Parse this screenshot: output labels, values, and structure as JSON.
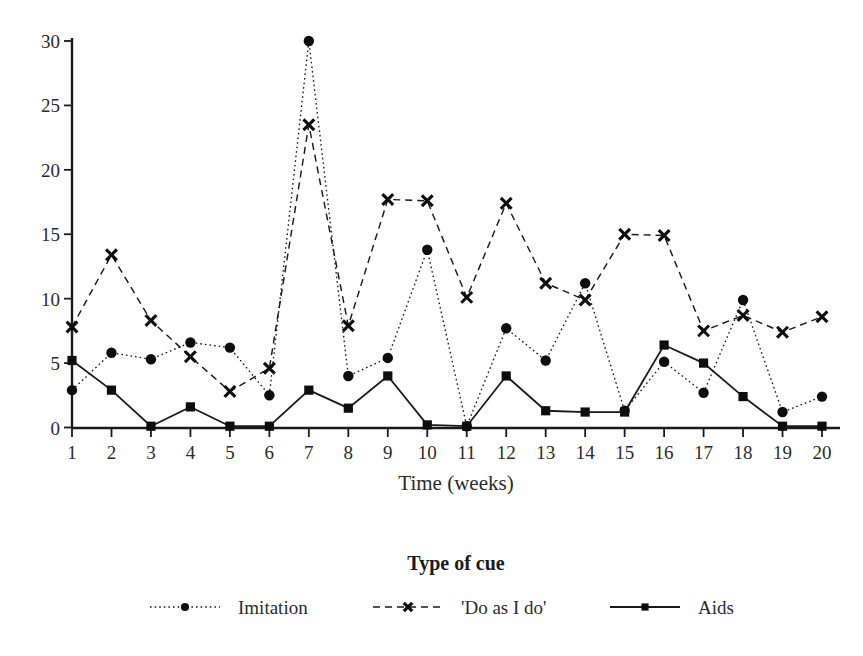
{
  "chart_data": {
    "type": "line",
    "title": "",
    "xlabel": "Time (weeks)",
    "ylabel": "",
    "legend_title": "Type of cue",
    "legend_position": "bottom",
    "grid": false,
    "xlim": [
      1,
      20
    ],
    "ylim": [
      0,
      30
    ],
    "yticks": [
      0,
      5,
      10,
      15,
      20,
      25,
      30
    ],
    "ytick_labels": [
      "0",
      "5",
      "10",
      "15",
      "20",
      "25",
      "30"
    ],
    "x": [
      1,
      2,
      3,
      4,
      5,
      6,
      7,
      8,
      9,
      10,
      11,
      12,
      13,
      14,
      15,
      16,
      17,
      18,
      19,
      20
    ],
    "xtick_labels": [
      "1",
      "2",
      "3",
      "4",
      "5",
      "6",
      "7",
      "8",
      "9",
      "10",
      "11",
      "12",
      "13",
      "14",
      "15",
      "16",
      "17",
      "18",
      "19",
      "20"
    ],
    "series": [
      {
        "name": "Imitation",
        "marker": "circle",
        "line_style": "dotted",
        "color": "#0d0d0d",
        "values": [
          2.9,
          5.8,
          5.3,
          6.6,
          6.2,
          2.5,
          30.0,
          4.0,
          5.4,
          13.8,
          0.1,
          7.7,
          5.2,
          11.2,
          1.3,
          5.1,
          2.7,
          9.9,
          1.2,
          2.4
        ]
      },
      {
        "name": "'Do as I do'",
        "marker": "x",
        "line_style": "dashed",
        "color": "#0d0d0d",
        "values": [
          7.8,
          13.4,
          8.3,
          5.5,
          2.8,
          4.6,
          23.5,
          7.9,
          17.7,
          17.6,
          10.1,
          17.4,
          11.2,
          9.9,
          15.0,
          14.9,
          7.5,
          8.7,
          7.4,
          8.6
        ]
      },
      {
        "name": "Aids",
        "marker": "square",
        "line_style": "solid",
        "color": "#0d0d0d",
        "values": [
          5.2,
          2.9,
          0.1,
          1.6,
          0.1,
          0.1,
          2.9,
          1.5,
          4.0,
          0.2,
          0.1,
          4.0,
          1.3,
          1.2,
          1.2,
          6.4,
          5.0,
          2.4,
          0.1,
          0.1
        ]
      }
    ]
  },
  "axes": {
    "x_axis_title": "Time (weeks)",
    "y_axis_title": ""
  },
  "legend": {
    "title": "Type of cue",
    "entries": [
      {
        "label": "Imitation"
      },
      {
        "label": "'Do as I do'"
      },
      {
        "label": "Aids"
      }
    ]
  }
}
